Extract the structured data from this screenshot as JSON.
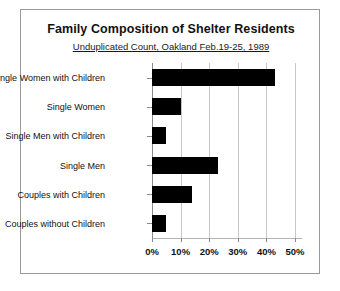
{
  "chart_data": {
    "type": "bar",
    "orientation": "horizontal",
    "title": "Family Composition of Shelter Residents",
    "subtitle": "Unduplicated Count, Oakland Feb.19-25, 1989",
    "xlabel": "",
    "ylabel": "",
    "categories": [
      "Single Women with Children",
      "Single Women",
      "Single Men with Children",
      "Single Men",
      "Couples with Children",
      "Couples without Children"
    ],
    "values": [
      43,
      10,
      5,
      23,
      14,
      5
    ],
    "value_unit": "%",
    "xlim": [
      0,
      50
    ],
    "xticks": [
      0,
      10,
      20,
      30,
      40,
      50
    ],
    "xtick_labels": [
      "0%",
      "10%",
      "20%",
      "30%",
      "40%",
      "50%"
    ],
    "grid": true,
    "legend": false,
    "bar_color": "#000000"
  }
}
